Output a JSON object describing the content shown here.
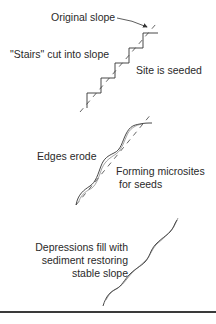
{
  "panels": [
    {
      "name": "stairs-cut",
      "labels": {
        "original_slope": "Original slope",
        "stairs_cut": "\"Stairs\" cut into slope",
        "site_seeded": "Site is seeded"
      }
    },
    {
      "name": "edges-erode",
      "labels": {
        "edges_erode": "Edges erode",
        "microsites_line1": "Forming microsites",
        "microsites_line2": "for seeds"
      }
    },
    {
      "name": "depressions-fill",
      "labels": {
        "line1": "Depressions fill with",
        "line2": "sediment restoring",
        "line3": "stable slope"
      }
    }
  ],
  "colors": {
    "line": "#333333",
    "dashed": "#555555",
    "background": "#ffffff"
  }
}
